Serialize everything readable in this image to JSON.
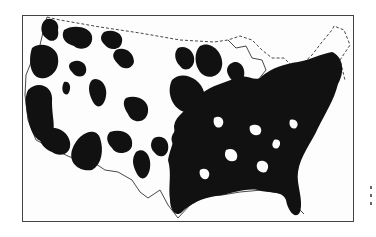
{
  "figure": {
    "type": "dot-distribution map",
    "region": "contiguous United States",
    "fill_color": "#111111",
    "outline_color": "#444444",
    "background_color": "#ffffff"
  }
}
